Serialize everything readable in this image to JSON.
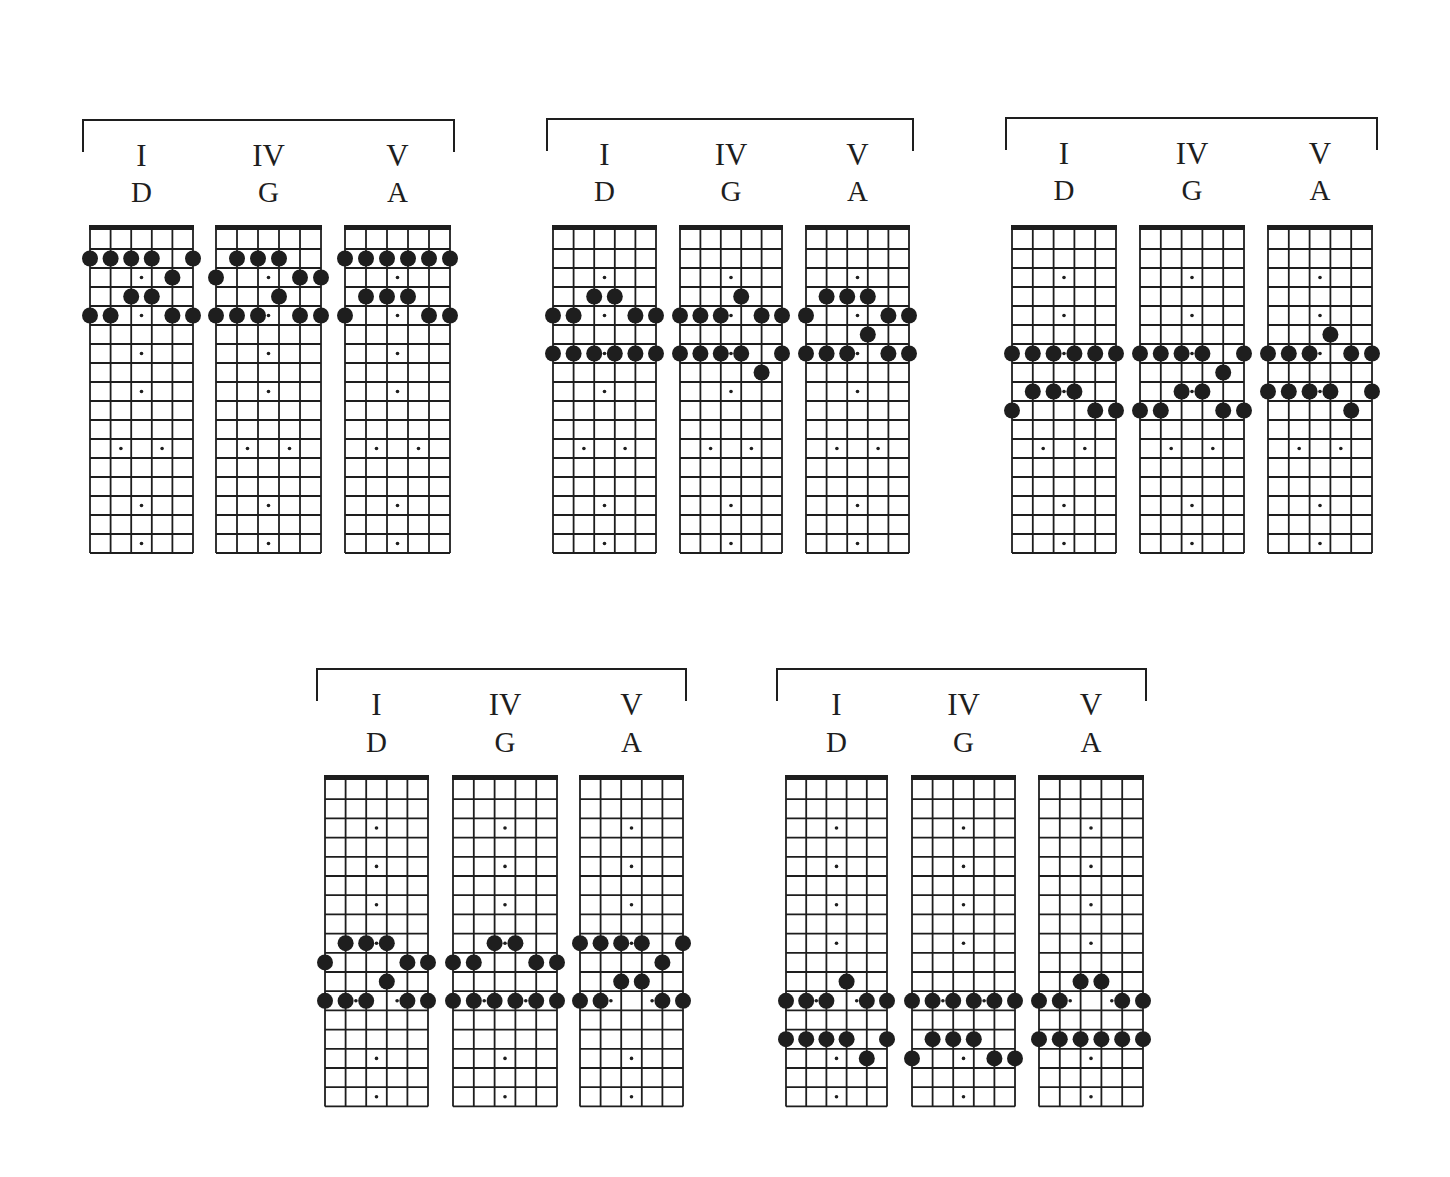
{
  "colors": {
    "ink": "#1e1e1e",
    "background": "#ffffff"
  },
  "fretboard": {
    "strings": 6,
    "frets": 17,
    "inlays_single": [
      3,
      5,
      7,
      9,
      15,
      17
    ],
    "inlays_double": [
      12
    ]
  },
  "groups": [
    {
      "name": "position-1",
      "bracket": {
        "x1": 83,
        "x2": 454,
        "y": 120,
        "drop": 32
      },
      "label_y": [
        166,
        202
      ],
      "nut_y": 226,
      "fret_h": 19.0,
      "boards": [
        {
          "numeral": "I",
          "chord": "D",
          "x": 90,
          "w": 103,
          "notes": [
            [
              2,
              [
                1,
                2,
                3,
                4,
                6
              ]
            ],
            [
              3,
              [
                5
              ]
            ],
            [
              4,
              [
                3,
                4
              ]
            ],
            [
              5,
              [
                1,
                2,
                5,
                6
              ]
            ]
          ]
        },
        {
          "numeral": "IV",
          "chord": "G",
          "x": 216,
          "w": 105,
          "notes": [
            [
              2,
              [
                2,
                3,
                4
              ]
            ],
            [
              3,
              [
                1,
                5,
                6
              ]
            ],
            [
              4,
              [
                4
              ]
            ],
            [
              5,
              [
                1,
                2,
                3,
                5,
                6
              ]
            ]
          ]
        },
        {
          "numeral": "V",
          "chord": "A",
          "x": 345,
          "w": 105,
          "notes": [
            [
              2,
              [
                1,
                2,
                3,
                4,
                5,
                6
              ]
            ],
            [
              4,
              [
                2,
                3,
                4
              ]
            ],
            [
              5,
              [
                1,
                5,
                6
              ]
            ]
          ]
        }
      ]
    },
    {
      "name": "position-2",
      "bracket": {
        "x1": 547,
        "x2": 913,
        "y": 119,
        "drop": 32
      },
      "label_y": [
        165,
        201
      ],
      "nut_y": 226,
      "fret_h": 19.0,
      "boards": [
        {
          "numeral": "I",
          "chord": "D",
          "x": 553,
          "w": 103,
          "notes": [
            [
              4,
              [
                3,
                4
              ]
            ],
            [
              5,
              [
                1,
                2,
                5,
                6
              ]
            ],
            [
              7,
              [
                1,
                2,
                3,
                4,
                5,
                6
              ]
            ]
          ]
        },
        {
          "numeral": "IV",
          "chord": "G",
          "x": 680,
          "w": 102,
          "notes": [
            [
              4,
              [
                4
              ]
            ],
            [
              5,
              [
                1,
                2,
                3,
                5,
                6
              ]
            ],
            [
              7,
              [
                1,
                2,
                3,
                4,
                6
              ]
            ],
            [
              8,
              [
                5
              ]
            ]
          ]
        },
        {
          "numeral": "V",
          "chord": "A",
          "x": 806,
          "w": 103,
          "notes": [
            [
              4,
              [
                2,
                3,
                4
              ]
            ],
            [
              5,
              [
                1,
                5,
                6
              ]
            ],
            [
              6,
              [
                4
              ]
            ],
            [
              7,
              [
                1,
                2,
                3,
                5,
                6
              ]
            ]
          ]
        }
      ]
    },
    {
      "name": "position-3",
      "bracket": {
        "x1": 1006,
        "x2": 1377,
        "y": 118,
        "drop": 32
      },
      "label_y": [
        164,
        200
      ],
      "nut_y": 226,
      "fret_h": 19.0,
      "boards": [
        {
          "numeral": "I",
          "chord": "D",
          "x": 1012,
          "w": 104,
          "notes": [
            [
              7,
              [
                1,
                2,
                3,
                4,
                5,
                6
              ]
            ],
            [
              9,
              [
                2,
                3,
                4
              ]
            ],
            [
              10,
              [
                1,
                5,
                6
              ]
            ]
          ]
        },
        {
          "numeral": "IV",
          "chord": "G",
          "x": 1140,
          "w": 104,
          "notes": [
            [
              7,
              [
                1,
                2,
                3,
                4,
                6
              ]
            ],
            [
              8,
              [
                5
              ]
            ],
            [
              9,
              [
                3,
                4
              ]
            ],
            [
              10,
              [
                1,
                2,
                5,
                6
              ]
            ]
          ]
        },
        {
          "numeral": "V",
          "chord": "A",
          "x": 1268,
          "w": 104,
          "notes": [
            [
              6,
              [
                4
              ]
            ],
            [
              7,
              [
                1,
                2,
                3,
                5,
                6
              ]
            ],
            [
              9,
              [
                1,
                2,
                3,
                4,
                6
              ]
            ],
            [
              10,
              [
                5
              ]
            ]
          ]
        }
      ]
    },
    {
      "name": "position-4",
      "bracket": {
        "x1": 317,
        "x2": 686,
        "y": 669,
        "drop": 32
      },
      "label_y": [
        715,
        752
      ],
      "nut_y": 776,
      "fret_h": 19.2,
      "boards": [
        {
          "numeral": "I",
          "chord": "D",
          "x": 325,
          "w": 103,
          "notes": [
            [
              9,
              [
                2,
                3,
                4
              ]
            ],
            [
              10,
              [
                1,
                5,
                6
              ]
            ],
            [
              11,
              [
                4
              ]
            ],
            [
              12,
              [
                1,
                2,
                3,
                5,
                6
              ]
            ]
          ]
        },
        {
          "numeral": "IV",
          "chord": "G",
          "x": 453,
          "w": 104,
          "notes": [
            [
              9,
              [
                3,
                4
              ]
            ],
            [
              10,
              [
                1,
                2,
                5,
                6
              ]
            ],
            [
              12,
              [
                1,
                2,
                3,
                4,
                5,
                6
              ]
            ]
          ]
        },
        {
          "numeral": "V",
          "chord": "A",
          "x": 580,
          "w": 103,
          "notes": [
            [
              9,
              [
                1,
                2,
                3,
                4,
                6
              ]
            ],
            [
              10,
              [
                5
              ]
            ],
            [
              11,
              [
                3,
                4
              ]
            ],
            [
              12,
              [
                1,
                2,
                5,
                6
              ]
            ]
          ]
        }
      ]
    },
    {
      "name": "position-5",
      "bracket": {
        "x1": 777,
        "x2": 1146,
        "y": 669,
        "drop": 32
      },
      "label_y": [
        715,
        752
      ],
      "nut_y": 776,
      "fret_h": 19.2,
      "boards": [
        {
          "numeral": "I",
          "chord": "D",
          "x": 786,
          "w": 101,
          "notes": [
            [
              11,
              [
                4
              ]
            ],
            [
              12,
              [
                1,
                2,
                3,
                5,
                6
              ]
            ],
            [
              14,
              [
                1,
                2,
                3,
                4,
                6
              ]
            ],
            [
              15,
              [
                5
              ]
            ]
          ]
        },
        {
          "numeral": "IV",
          "chord": "G",
          "x": 912,
          "w": 103,
          "notes": [
            [
              12,
              [
                1,
                2,
                3,
                4,
                5,
                6
              ]
            ],
            [
              14,
              [
                2,
                3,
                4
              ]
            ],
            [
              15,
              [
                1,
                5,
                6
              ]
            ]
          ]
        },
        {
          "numeral": "V",
          "chord": "A",
          "x": 1039,
          "w": 104,
          "notes": [
            [
              11,
              [
                3,
                4
              ]
            ],
            [
              12,
              [
                1,
                2,
                5,
                6
              ]
            ],
            [
              14,
              [
                1,
                2,
                3,
                4,
                5,
                6
              ]
            ]
          ]
        }
      ]
    }
  ]
}
